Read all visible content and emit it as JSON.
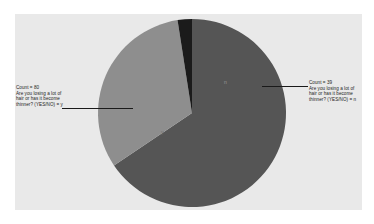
{
  "chart_data": {
    "type": "pie",
    "title": "",
    "subtitle": "",
    "xlabel": "",
    "ylabel": "",
    "legend_position": "none",
    "grid": false,
    "categories": [
      "y",
      "n",
      "(blank)"
    ],
    "values": [
      80,
      39,
      3
    ],
    "percentages": [
      65.6,
      32.0,
      2.4
    ],
    "colors": [
      "#555555",
      "#8e8e8e",
      "#1b1b1b"
    ],
    "background": "#e9e9e9",
    "slice_labels": [
      {
        "name": "y",
        "text": "y"
      },
      {
        "name": "n",
        "text": "n"
      }
    ],
    "annotations": [
      {
        "name": "callout-left",
        "side": "left",
        "lines": [
          "Count = 80",
          "Are you losing a lot of",
          "hair or has it become",
          "thinner? (YES/NO) = y"
        ],
        "count": 80,
        "category": "y"
      },
      {
        "name": "callout-right",
        "side": "right",
        "lines": [
          "Count = 39",
          "Are you losing a lot of",
          "hair or has it become",
          "thinner? (YES/NO) = n"
        ],
        "count": 39,
        "category": "n"
      }
    ]
  },
  "callout_left": {
    "line1": "Count = 80",
    "line2": "Are you losing a lot of",
    "line3": "hair or has it become",
    "line4": "thinner? (YES/NO) = y"
  },
  "callout_right": {
    "line1": "Count = 39",
    "line2": "Are you losing a lot of",
    "line3": "hair or has it become",
    "line4": "thinner? (YES/NO) = n"
  },
  "slice_labels": {
    "light": "n",
    "dark": "y"
  }
}
